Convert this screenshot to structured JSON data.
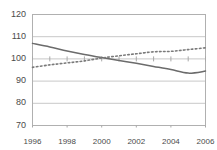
{
  "chart_data": {
    "type": "line",
    "title": "",
    "subtitle": "",
    "xlabel": "",
    "ylabel": "",
    "xlim": [
      1996,
      2006
    ],
    "ylim": [
      70,
      120
    ],
    "grid": true,
    "gridlines_y": [
      70,
      80,
      90,
      100,
      110,
      120
    ],
    "legend": "none",
    "legend_position": "none",
    "y_ticks": [
      120,
      110,
      100,
      90,
      80,
      70
    ],
    "y_tick_labels": [
      "120",
      "110",
      "100",
      "90",
      "80",
      "70"
    ],
    "x_ticks": [
      1996,
      1998,
      2000,
      2002,
      2004,
      2006
    ],
    "x_tick_labels": [
      "1996",
      "1998",
      "2000",
      "2002",
      "2004",
      "2006"
    ],
    "x_minor_ticks": [
      1997,
      1999,
      2001,
      2003,
      2005
    ],
    "axis_baseline_value": 100,
    "x": [
      1996,
      1997,
      1998,
      1999,
      2000,
      2001,
      2002,
      2003,
      2004,
      2005,
      2006
    ],
    "series": [
      {
        "name": "solid-series",
        "style": "solid",
        "color": "#6b6b6b",
        "values": [
          107.0,
          105.4,
          103.6,
          102.0,
          100.6,
          99.3,
          98.0,
          96.6,
          95.2,
          93.6,
          94.5
        ]
      },
      {
        "name": "dotted-series",
        "style": "dotted",
        "color": "#7a7a7a",
        "values": [
          96.2,
          97.3,
          98.2,
          99.1,
          100.4,
          101.4,
          102.3,
          103.2,
          103.4,
          104.2,
          105.0
        ]
      }
    ]
  },
  "axes": {
    "plot_border_color": "#b0b0b0",
    "gridline_color": "#c8c8c8",
    "tick_color": "#a8a8a8",
    "label_color": "#4a4a4a"
  }
}
